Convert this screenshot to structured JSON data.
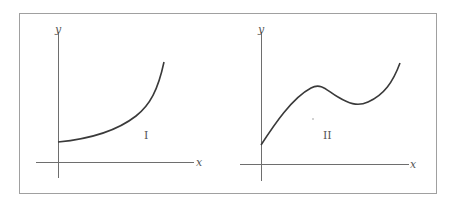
{
  "figure": {
    "frame_color": "#9a9a9a",
    "axis_color": "#6e6e6e",
    "curve_color": "#3a3a3a",
    "panels": [
      {
        "id": "I",
        "label": "I",
        "x_axis_label": "x",
        "y_axis_label": "y",
        "description": "Increasing, concave-up curve starting at positive y-intercept"
      },
      {
        "id": "II",
        "label": "II",
        "x_axis_label": "x",
        "y_axis_label": "y",
        "description": "Curve rising to a local maximum, dipping to a local minimum, then rising steeply"
      }
    ]
  }
}
